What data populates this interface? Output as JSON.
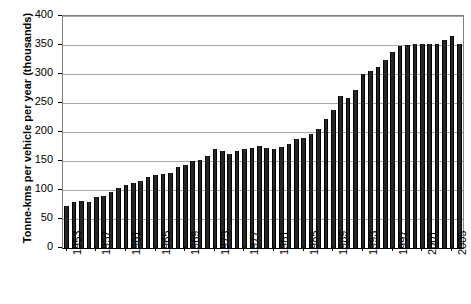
{
  "chart_data": {
    "type": "bar",
    "title": "",
    "subtitle": "",
    "xlabel": "",
    "ylabel": "Tonne-kms per vehicle per year (thousands)",
    "ylim": [
      0,
      400
    ],
    "ytick_labels": [
      "0",
      "50",
      "100",
      "150",
      "200",
      "250",
      "300",
      "350",
      "400"
    ],
    "ytick_values": [
      0,
      50,
      100,
      150,
      200,
      250,
      300,
      350,
      400
    ],
    "grid": "horizontal",
    "legend": "none",
    "xtick_labels": [
      "1953",
      "1957",
      "1961",
      "1965",
      "1969",
      "1973",
      "1977",
      "1981",
      "1985",
      "1989",
      "1993",
      "1997",
      "2001",
      "2005"
    ],
    "xtick_values": [
      1953,
      1957,
      1961,
      1965,
      1969,
      1973,
      1977,
      1981,
      1985,
      1989,
      1993,
      1997,
      2001,
      2005
    ],
    "x_start": 1953,
    "x_end": 2006,
    "bar_color": "#262626",
    "categories": [
      "1953",
      "1954",
      "1955",
      "1956",
      "1957",
      "1958",
      "1959",
      "1960",
      "1961",
      "1962",
      "1963",
      "1964",
      "1965",
      "1966",
      "1967",
      "1968",
      "1969",
      "1970",
      "1971",
      "1972",
      "1973",
      "1974",
      "1975",
      "1976",
      "1977",
      "1978",
      "1979",
      "1980",
      "1981",
      "1982",
      "1983",
      "1984",
      "1985",
      "1986",
      "1987",
      "1988",
      "1989",
      "1990",
      "1991",
      "1992",
      "1993",
      "1994",
      "1995",
      "1996",
      "1997",
      "1998",
      "1999",
      "2000",
      "2001",
      "2002",
      "2003",
      "2004",
      "2005",
      "2006"
    ],
    "values": [
      72,
      79,
      81,
      80,
      88,
      90,
      97,
      103,
      108,
      112,
      116,
      122,
      126,
      128,
      130,
      140,
      143,
      150,
      152,
      158,
      171,
      168,
      162,
      168,
      170,
      173,
      176,
      172,
      170,
      175,
      180,
      188,
      190,
      196,
      206,
      222,
      238,
      262,
      258,
      272,
      300,
      305,
      312,
      324,
      338,
      348,
      350,
      351,
      352,
      351,
      352,
      358,
      365,
      352
    ]
  }
}
